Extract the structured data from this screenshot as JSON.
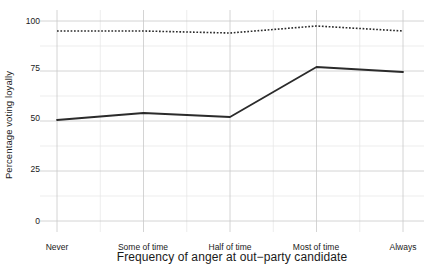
{
  "chart_data": {
    "type": "line",
    "title": "",
    "xlabel": "Frequency of anger at out−party candidate",
    "ylabel": "Percentage voting loyally",
    "categories": [
      "Never",
      "Some of time",
      "Half of time",
      "Most of time",
      "Always"
    ],
    "ylim": [
      0,
      100
    ],
    "yticks": [
      0,
      25,
      50,
      75,
      100
    ],
    "ytick_labels": [
      "0",
      "25",
      "50",
      "75",
      "100"
    ],
    "grid": true,
    "legend": "none",
    "series": [
      {
        "name": "dotted-upper-series",
        "style": "dotted",
        "color": "#2b2b2b",
        "values": [
          95,
          95,
          94,
          97.5,
          95
        ]
      },
      {
        "name": "solid-lower-series",
        "style": "solid",
        "color": "#2b2b2b",
        "values": [
          50.5,
          54,
          52,
          77,
          74.5
        ]
      }
    ]
  },
  "axes": {
    "y_title": "Percentage voting loyally",
    "x_title": "Frequency of anger at out−party candidate",
    "y_tick_labels": [
      "100",
      "75",
      "50",
      "25",
      "0"
    ],
    "x_tick_labels": [
      "Never",
      "Some of time",
      "Half of time",
      "Most of time",
      "Always"
    ]
  },
  "colors": {
    "background": "#ffffff",
    "grid_major": "#c9c9c9",
    "grid_minor": "#e8e8e8",
    "line": "#2b2b2b",
    "text": "#1a1a1a"
  }
}
